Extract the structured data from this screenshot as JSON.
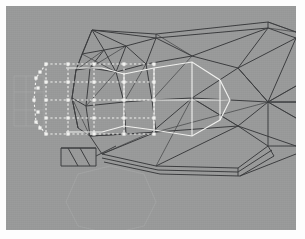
{
  "app": {
    "window_title": "3D Wireframe Viewport",
    "view_label": "Side Orthographic",
    "background_color": "#999a9a",
    "canvas_border_color": "#fdfdfd"
  },
  "viewport": {
    "width": 290,
    "height": 224,
    "offset_x": 6,
    "offset_y": 6,
    "shading_mode": "wireframe",
    "mesh_color": "#3b3c3e",
    "selection_color": "#f2f2f0",
    "ghost_color": "#aeafaf"
  },
  "scene": {
    "mesh_name": "body-mesh",
    "selection_name": "selected-vertex-cage",
    "ghost_name": "reference-ghost-geometry",
    "highlight_name": "highlighted-face-loop"
  },
  "geometry": {
    "mesh_edges": [
      "M 150 28 L 262 16 L 290 26",
      "M 150 32 L 262 22 L 290 32",
      "M 150 28 L 150 32",
      "M 262 16 L 262 22",
      "M 86 24 L 150 28",
      "M 86 24 L 150 32",
      "M 86 24 L 76 48",
      "M 86 24 L 98 44",
      "M 86 24 L 120 40",
      "M 86 24 L 70 64",
      "M 76 48 L 98 44",
      "M 76 48 L 70 64",
      "M 98 44 L 120 40",
      "M 98 44 L 110 66",
      "M 98 44 L 84 62",
      "M 120 40 L 150 32",
      "M 120 40 L 140 58",
      "M 120 40 L 110 66",
      "M 70 64 L 84 62",
      "M 70 64 L 66 92",
      "M 84 62 L 110 66",
      "M 84 62 L 80 100",
      "M 110 66 L 140 58",
      "M 110 66 L 118 96",
      "M 140 58 L 150 32",
      "M 140 58 L 186 50",
      "M 140 58 L 146 94",
      "M 150 32 L 186 50",
      "M 186 50 L 262 22",
      "M 186 50 L 232 62",
      "M 232 62 L 262 22",
      "M 232 62 L 290 32",
      "M 232 62 L 262 96",
      "M 232 62 L 186 92",
      "M 262 96 L 290 32",
      "M 262 96 L 290 80",
      "M 262 96 L 290 96",
      "M 262 96 L 290 112",
      "M 262 96 L 232 62",
      "M 262 96 L 186 92",
      "M 262 96 L 232 120",
      "M 66 92 L 80 100",
      "M 66 92 L 70 64",
      "M 66 92 L 72 122",
      "M 80 100 L 118 96",
      "M 80 100 L 84 130",
      "M 118 96 L 146 94",
      "M 118 96 L 120 128",
      "M 146 94 L 186 92",
      "M 146 94 L 150 126",
      "M 186 92 L 232 120",
      "M 186 92 L 146 126",
      "M 72 122 L 84 130",
      "M 72 122 L 66 92",
      "M 84 130 L 120 128",
      "M 120 128 L 150 126",
      "M 150 126 L 146 126",
      "M 84 130 L 96 148",
      "M 96 148 L 150 160",
      "M 150 160 L 232 162",
      "M 232 162 L 262 140",
      "M 262 140 L 290 140",
      "M 96 152 L 152 164",
      "M 152 164 L 232 166",
      "M 232 166 L 266 144",
      "M 98 156 L 154 168",
      "M 154 168 L 234 170",
      "M 234 170 L 268 150",
      "M 232 162 L 232 170",
      "M 262 140 L 268 150",
      "M 234 170 L 290 148",
      "M 262 140 L 262 96",
      "M 150 126 L 232 120",
      "M 232 120 L 262 140",
      "M 232 120 L 290 140",
      "M 150 160 L 232 120",
      "M 96 148 L 150 126",
      "M 84 130 L 120 128",
      "M 290 96 L 262 96",
      "M 55 142 L 55 160 L 90 160 L 90 142 Z",
      "M 55 142 L 90 142",
      "M 62 142 L 72 160",
      "M 74 142 L 84 160",
      "M 90 150 L 110 140"
    ],
    "mesh_edges_thin": [
      "M 150 28 L 186 50",
      "M 262 16 L 290 26",
      "M 120 40 L 84 62",
      "M 110 66 L 80 100",
      "M 140 58 L 118 96",
      "M 186 50 L 146 94",
      "M 98 44 L 70 64",
      "M 186 92 L 150 160",
      "M 146 126 L 96 148",
      "M 262 96 L 150 126",
      "M 232 120 L 186 92",
      "M 290 112 L 262 96",
      "M 290 80 L 262 96",
      "M 290 26 L 262 22",
      "M 76 48 L 110 66",
      "M 66 92 L 84 130"
    ],
    "selection_solid": [
      "M 148 62 L 186 56 L 214 74 L 224 94 L 214 114 L 186 130 L 148 124",
      "M 148 62 L 148 124",
      "M 186 56 L 186 130",
      "M 214 74 L 214 114",
      "M 118 68 L 148 62",
      "M 118 120 L 148 124",
      "M 108 94 L 224 94",
      "M 96 62 L 118 68",
      "M 96 126 L 118 120",
      "M 118 68 L 118 120",
      "M 60 62 L 96 62",
      "M 60 126 L 96 126"
    ],
    "selection_dashed": [
      "M 40 58 L 148 58",
      "M 40 128 L 148 128",
      "M 40 94 L 148 94",
      "M 40 58 L 40 128",
      "M 62 58 L 62 128",
      "M 88 58 L 88 128",
      "M 118 58 L 118 128",
      "M 148 58 L 148 128",
      "M 40 58 L 30 72 L 28 94 L 30 116 L 40 128",
      "M 40 76 L 148 76",
      "M 40 112 L 148 112"
    ],
    "selection_vertices": [
      [
        40,
        58
      ],
      [
        62,
        58
      ],
      [
        88,
        58
      ],
      [
        118,
        58
      ],
      [
        148,
        58
      ],
      [
        40,
        76
      ],
      [
        62,
        76
      ],
      [
        88,
        76
      ],
      [
        118,
        76
      ],
      [
        148,
        76
      ],
      [
        40,
        94
      ],
      [
        62,
        94
      ],
      [
        88,
        94
      ],
      [
        118,
        94
      ],
      [
        148,
        94
      ],
      [
        40,
        112
      ],
      [
        62,
        112
      ],
      [
        88,
        112
      ],
      [
        118,
        112
      ],
      [
        148,
        112
      ],
      [
        40,
        128
      ],
      [
        62,
        128
      ],
      [
        88,
        128
      ],
      [
        118,
        128
      ],
      [
        148,
        128
      ],
      [
        30,
        72
      ],
      [
        28,
        94
      ],
      [
        30,
        116
      ],
      [
        34,
        66
      ],
      [
        32,
        82
      ],
      [
        32,
        106
      ],
      [
        34,
        122
      ]
    ],
    "ghost_paths": [
      "M 8 70 L 38 70 L 38 120 L 8 120 Z",
      "M 8 86 L 38 86",
      "M 8 104 L 38 104",
      "M 20 70 L 20 120",
      "M 72 168 L 104 160 L 138 168 L 150 196 L 138 220 L 104 228 L 72 220 L 60 196 Z"
    ]
  }
}
